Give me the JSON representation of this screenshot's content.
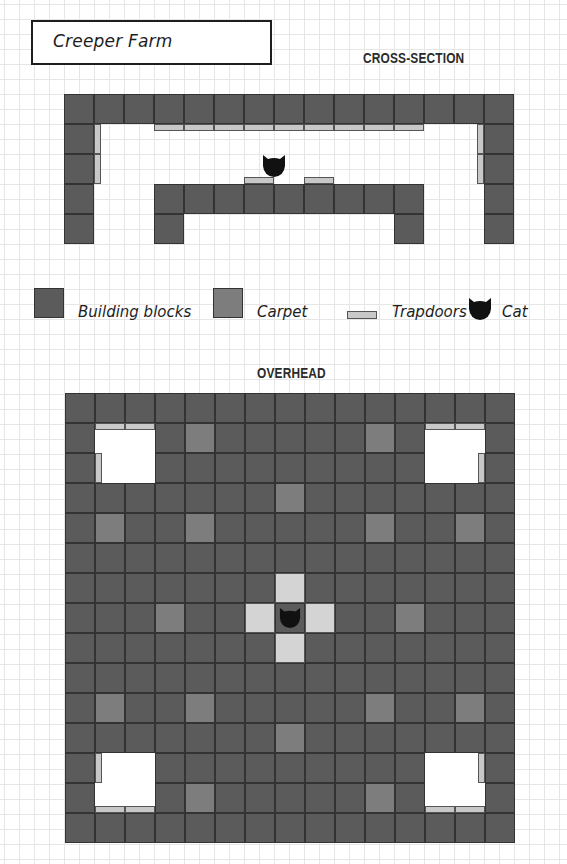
{
  "title": "Creeper Farm",
  "cross_section": {
    "heading": "CROSS-SECTION",
    "origin": [
      64,
      94
    ],
    "cell_size": 30,
    "blocks": [
      [
        0,
        0
      ],
      [
        1,
        0
      ],
      [
        2,
        0
      ],
      [
        3,
        0
      ],
      [
        4,
        0
      ],
      [
        5,
        0
      ],
      [
        6,
        0
      ],
      [
        7,
        0
      ],
      [
        8,
        0
      ],
      [
        9,
        0
      ],
      [
        10,
        0
      ],
      [
        11,
        0
      ],
      [
        12,
        0
      ],
      [
        13,
        0
      ],
      [
        14,
        0
      ],
      [
        0,
        1
      ],
      [
        0,
        2
      ],
      [
        0,
        3
      ],
      [
        0,
        4
      ],
      [
        14,
        1
      ],
      [
        14,
        2
      ],
      [
        14,
        3
      ],
      [
        14,
        4
      ],
      [
        3,
        3
      ],
      [
        4,
        3
      ],
      [
        5,
        3
      ],
      [
        6,
        3
      ],
      [
        7,
        3
      ],
      [
        8,
        3
      ],
      [
        9,
        3
      ],
      [
        10,
        3
      ],
      [
        11,
        3
      ],
      [
        3,
        4
      ],
      [
        11,
        4
      ]
    ],
    "trapdoors": [
      {
        "x": 154,
        "y": 124,
        "w": 30,
        "h": 7
      },
      {
        "x": 184,
        "y": 124,
        "w": 30,
        "h": 7
      },
      {
        "x": 214,
        "y": 124,
        "w": 30,
        "h": 7
      },
      {
        "x": 244,
        "y": 124,
        "w": 30,
        "h": 7
      },
      {
        "x": 274,
        "y": 124,
        "w": 30,
        "h": 7
      },
      {
        "x": 304,
        "y": 124,
        "w": 30,
        "h": 7
      },
      {
        "x": 334,
        "y": 124,
        "w": 30,
        "h": 7
      },
      {
        "x": 364,
        "y": 124,
        "w": 30,
        "h": 7
      },
      {
        "x": 394,
        "y": 124,
        "w": 30,
        "h": 7
      },
      {
        "x": 94,
        "y": 124,
        "w": 7,
        "h": 30
      },
      {
        "x": 94,
        "y": 154,
        "w": 7,
        "h": 30
      },
      {
        "x": 477,
        "y": 124,
        "w": 7,
        "h": 30
      },
      {
        "x": 477,
        "y": 154,
        "w": 7,
        "h": 30
      },
      {
        "x": 244,
        "y": 177,
        "w": 30,
        "h": 7
      },
      {
        "x": 304,
        "y": 177,
        "w": 30,
        "h": 7
      }
    ],
    "cat": {
      "x": 274,
      "y": 154
    }
  },
  "legend": {
    "items": [
      {
        "label": "Building blocks",
        "type": "block"
      },
      {
        "label": "Carpet",
        "type": "carpet"
      },
      {
        "label": "Trapdoors",
        "type": "trapdoor"
      },
      {
        "label": "Cat",
        "type": "cat"
      }
    ]
  },
  "overhead": {
    "heading": "OVERHEAD",
    "origin": [
      65,
      393
    ],
    "cell_size": 30,
    "grid_size": 15,
    "holes": [
      [
        1,
        1
      ],
      [
        2,
        1
      ],
      [
        1,
        2
      ],
      [
        2,
        2
      ],
      [
        12,
        1
      ],
      [
        13,
        1
      ],
      [
        12,
        2
      ],
      [
        13,
        2
      ],
      [
        1,
        12
      ],
      [
        2,
        12
      ],
      [
        1,
        13
      ],
      [
        2,
        13
      ],
      [
        12,
        12
      ],
      [
        13,
        12
      ],
      [
        12,
        13
      ],
      [
        13,
        13
      ]
    ],
    "carpets": [
      [
        4,
        1
      ],
      [
        10,
        1
      ],
      [
        7,
        3
      ],
      [
        1,
        4
      ],
      [
        4,
        4
      ],
      [
        10,
        4
      ],
      [
        13,
        4
      ],
      [
        3,
        7
      ],
      [
        11,
        7
      ],
      [
        1,
        10
      ],
      [
        4,
        10
      ],
      [
        10,
        10
      ],
      [
        13,
        10
      ],
      [
        7,
        11
      ],
      [
        4,
        13
      ],
      [
        10,
        13
      ]
    ],
    "center_trapdoors": [
      [
        7,
        6
      ],
      [
        6,
        7
      ],
      [
        8,
        7
      ],
      [
        7,
        8
      ]
    ],
    "cat_cell": [
      7,
      7
    ],
    "hole_trapdoors": [
      {
        "x": 95,
        "y": 423,
        "w": 30,
        "h": 7
      },
      {
        "x": 125,
        "y": 423,
        "w": 30,
        "h": 7
      },
      {
        "x": 95,
        "y": 453,
        "w": 7,
        "h": 30
      },
      {
        "x": 425,
        "y": 423,
        "w": 30,
        "h": 7
      },
      {
        "x": 455,
        "y": 423,
        "w": 30,
        "h": 7
      },
      {
        "x": 478,
        "y": 453,
        "w": 7,
        "h": 30
      },
      {
        "x": 95,
        "y": 753,
        "w": 7,
        "h": 30
      },
      {
        "x": 95,
        "y": 806,
        "w": 30,
        "h": 7
      },
      {
        "x": 125,
        "y": 806,
        "w": 30,
        "h": 7
      },
      {
        "x": 478,
        "y": 753,
        "w": 7,
        "h": 30
      },
      {
        "x": 425,
        "y": 806,
        "w": 30,
        "h": 7
      },
      {
        "x": 455,
        "y": 806,
        "w": 30,
        "h": 7
      }
    ]
  },
  "colors": {
    "block": "#5b5b5b",
    "carpet": "#7d7d7d",
    "trapdoor": "#c8c8c8",
    "trapdoor_floor": "#d4d4d4",
    "cat": "#111111",
    "grid_line": "#e6e6e6"
  }
}
